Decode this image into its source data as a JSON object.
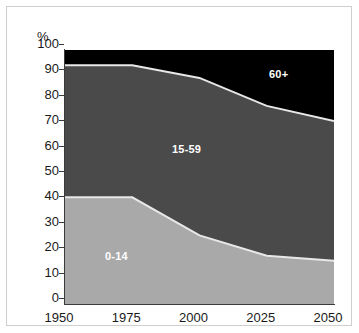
{
  "chart_data": {
    "type": "area",
    "stacked": true,
    "title": "",
    "subtitle": "",
    "xlabel": "",
    "ylabel": "%",
    "x": [
      1950,
      1975,
      2000,
      2025,
      2050
    ],
    "xtick_labels": [
      "1950",
      "1975",
      "2000",
      "2025",
      "2050"
    ],
    "ytick_labels": [
      "0",
      "10",
      "20",
      "30",
      "40",
      "50",
      "60",
      "70",
      "80",
      "90",
      "100"
    ],
    "ytick_values": [
      0,
      10,
      20,
      30,
      40,
      50,
      60,
      70,
      80,
      90,
      100
    ],
    "ylim": [
      0,
      100
    ],
    "xlim": [
      1950,
      2050
    ],
    "grid": false,
    "legend": "inline-labels",
    "series": [
      {
        "name": "0-14",
        "label": "0-14",
        "color": "#a9a9a9",
        "label_color": "#ffffff",
        "values": [
          42,
          42,
          27,
          19,
          17
        ]
      },
      {
        "name": "15-59",
        "label": "15-59",
        "color": "#4a4a4a",
        "label_color": "#ffffff",
        "values": [
          52,
          52,
          62,
          59,
          55
        ]
      },
      {
        "name": "60+",
        "label": "60+",
        "color": "#000000",
        "label_color": "#ffffff",
        "values": [
          6,
          6,
          11,
          22,
          28
        ]
      }
    ],
    "cumulative_tops": {
      "series_0_14": [
        42,
        42,
        27,
        19,
        17
      ],
      "series_15_59": [
        94,
        94,
        89,
        78,
        72
      ],
      "series_60_plus": [
        100,
        100,
        100,
        100,
        100
      ]
    },
    "separator_color": "#e8e8e8",
    "axis_color": "#3b3b3b",
    "background": "#ffffff"
  },
  "axis": {
    "y_unit": "%"
  }
}
